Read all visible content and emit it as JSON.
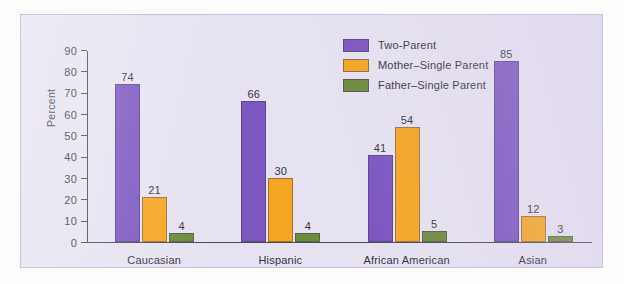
{
  "chart_data": {
    "type": "bar",
    "title": "",
    "xlabel": "",
    "ylabel": "Percent",
    "ylim": [
      0,
      90
    ],
    "ytick_step": 10,
    "yticks": [
      90,
      80,
      70,
      60,
      50,
      40,
      30,
      20,
      10,
      0
    ],
    "grid": false,
    "legend_position": "top-right",
    "categories": [
      "Caucasian",
      "Hispanic",
      "African American",
      "Asian"
    ],
    "series": [
      {
        "name": "Two-Parent",
        "color": "#7d57c0",
        "values": [
          74,
          66,
          41,
          85
        ]
      },
      {
        "name": "Mother–Single Parent",
        "color": "#f5a623",
        "values": [
          21,
          30,
          54,
          12
        ]
      },
      {
        "name": "Father–Single Parent",
        "color": "#6e8b3d",
        "values": [
          4,
          4,
          5,
          3
        ]
      }
    ]
  },
  "panel": {
    "background_color": "#e7e2f1",
    "border_color": "#c9c2de"
  },
  "axis": {
    "line_color": "#4a4a52"
  }
}
